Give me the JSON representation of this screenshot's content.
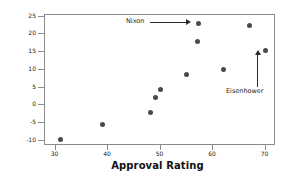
{
  "chart_data": {
    "type": "scatter",
    "title": "",
    "xlabel": "Approval Rating",
    "ylabel": "Margin of Victory",
    "xlim": [
      28,
      72
    ],
    "ylim": [
      -11.5,
      25.5
    ],
    "xticks": [
      30,
      40,
      50,
      60,
      70
    ],
    "xtick_labels": [
      "30",
      "40",
      "50",
      "60",
      "70"
    ],
    "yticks": [
      -10,
      -5,
      0,
      5,
      10,
      15,
      20,
      25
    ],
    "ytick_labels": [
      "-10",
      "-5",
      "0",
      "5",
      "10",
      "15",
      "20",
      "25"
    ],
    "grid": false,
    "legend": "none",
    "marker_color": "#4a4a4a",
    "frame_color": "#8a8a8a",
    "points": [
      {
        "x": 31.0,
        "y": -9.7
      },
      {
        "x": 39.0,
        "y": -5.4
      },
      {
        "x": 48.0,
        "y": -2.0
      },
      {
        "x": 49.0,
        "y": 2.3
      },
      {
        "x": 50.0,
        "y": 4.5
      },
      {
        "x": 55.0,
        "y": 8.6
      },
      {
        "x": 57.0,
        "y": 18.1
      },
      {
        "x": 57.3,
        "y": 23.2
      },
      {
        "x": 62.0,
        "y": 10.1
      },
      {
        "x": 67.0,
        "y": 22.6
      },
      {
        "x": 70.0,
        "y": 15.5
      }
    ],
    "annotations": [
      {
        "label": "Nixon",
        "target_x": 57.3,
        "target_y": 23.2
      },
      {
        "label": "Eisenhower",
        "target_x": 70.0,
        "target_y": 15.5
      }
    ]
  }
}
